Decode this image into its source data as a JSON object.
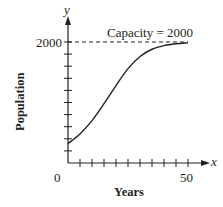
{
  "chart_data": {
    "type": "line",
    "title": "",
    "xlabel": "Years",
    "ylabel": "Population",
    "x_axis_symbol": "x",
    "y_axis_symbol": "y",
    "xlim": [
      0,
      50
    ],
    "ylim": [
      0,
      2000
    ],
    "x_tick_labels": [
      "0",
      "50"
    ],
    "y_tick_labels": [
      "2000"
    ],
    "x_tick_step": 5,
    "y_tick_step": 200,
    "grid": false,
    "annotation": "Capacity = 2000",
    "capacity_line": 2000,
    "series": [
      {
        "name": "Population",
        "x": [
          0,
          5,
          10,
          15,
          20,
          25,
          30,
          35,
          40,
          45,
          50
        ],
        "y": [
          320,
          480,
          700,
          980,
          1280,
          1560,
          1760,
          1880,
          1940,
          1970,
          1985
        ]
      }
    ]
  }
}
